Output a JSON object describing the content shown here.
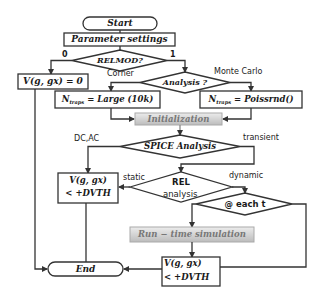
{
  "diagram": {
    "type": "flowchart",
    "nodes": {
      "start": "Start",
      "params": "Parameter settings",
      "relmod": "RELMOD?",
      "v_zero": "V(g, gx) = 0",
      "analysis": "Analysis ?",
      "ntraps_large_prefix": "N",
      "ntraps_large_sub": "traps",
      "ntraps_large_rest": " = Large (10k)",
      "ntraps_poiss_prefix": "N",
      "ntraps_poiss_sub": "traps",
      "ntraps_poiss_rest": " = Poissrnd()",
      "init": "Initialization",
      "spice": "SPICE Analysis",
      "rel_line1": "REL",
      "rel_line2": "analysis",
      "v_dvth_left_line1": "V(g, gx)",
      "v_dvth_left_line2": "< +DVTH",
      "each_t": "@ each t",
      "runtime": "Run − time simulation",
      "end": "End",
      "v_dvth_bottom_line1": "V(g, gx)",
      "v_dvth_bottom_line2": "< +DVTH"
    },
    "edge_labels": {
      "relmod_no": "0",
      "relmod_yes": "1",
      "corner": "Corner",
      "monte_carlo": "Monte Carlo",
      "dc_ac": "DC,AC",
      "transient": "transient",
      "static": "static",
      "dynamic": "dynamic"
    },
    "colors": {
      "stroke": "#333333",
      "gradient_top": "#e6e6e6",
      "gradient_bottom": "#b8b8b8",
      "gradient_text": "#7a7a7a"
    }
  }
}
